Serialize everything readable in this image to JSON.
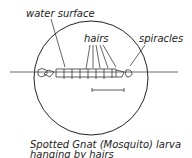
{
  "labels": {
    "water_surface": "water surface",
    "hairs": "hairs",
    "spiracles": "spiracles"
  },
  "caption": {
    "line1": "Spotted Gnat (Mosquito) larva",
    "line2": "hanging by hairs"
  },
  "colors": {
    "ink": "#222222",
    "background": "#ffffff"
  }
}
